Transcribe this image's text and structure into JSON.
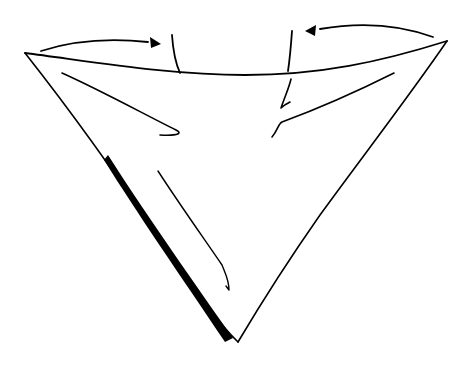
{
  "illustration": {
    "subject": "folded triangle scarf with fold arrows",
    "colors": {
      "ink": "#000000",
      "background": "#ffffff"
    },
    "arrows": [
      {
        "name": "left-fold-arrow",
        "direction": "right"
      },
      {
        "name": "right-fold-arrow",
        "direction": "left"
      }
    ]
  }
}
